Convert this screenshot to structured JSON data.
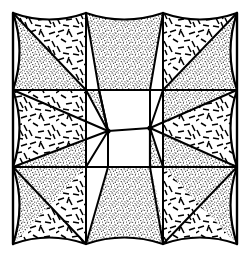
{
  "figure": {
    "kind": "geometric-line-drawing",
    "caption": "",
    "canvas": {
      "width": 248,
      "height": 259,
      "background": "#ffffff"
    },
    "ink_color": "#000000",
    "stipple_color": "#000000",
    "dash_color": "#000000"
  },
  "frame": {
    "name": "outer-border",
    "left": 13,
    "top": 13,
    "right": 237,
    "bottom": 244,
    "stroke_width": 2.2
  },
  "grid": {
    "columns": 3,
    "rows": 3,
    "vertical_lines_x": [
      86,
      163
    ],
    "horizontal_lines_y": [
      90,
      167
    ],
    "stroke_width": 2.0
  },
  "center": {
    "node_left": {
      "x": 108,
      "y": 131
    },
    "node_right": {
      "x": 150,
      "y": 128
    },
    "shape": "white-zigzag-parallelogram",
    "spokes_per_node": 6
  },
  "textures": {
    "stipple": {
      "name": "fine-dot-stipple",
      "density": "high",
      "dot_radius": 0.55
    },
    "dash": {
      "name": "scattered-dash-hatch",
      "density": "low",
      "dash_length": 7
    }
  },
  "cells": [
    {
      "index": 0,
      "name": "cell-top-left",
      "row": 0,
      "col": 0,
      "upper_fill": "dash",
      "lower_fill": "stipple",
      "concave_edges": [
        "top",
        "left"
      ]
    },
    {
      "index": 1,
      "name": "cell-top-center",
      "row": 0,
      "col": 1,
      "upper_fill": "stipple",
      "lower_fill": "blank",
      "concave_edges": [
        "top"
      ]
    },
    {
      "index": 2,
      "name": "cell-top-right",
      "row": 0,
      "col": 2,
      "upper_fill": "dash",
      "lower_fill": "stipple",
      "concave_edges": [
        "top",
        "right"
      ]
    },
    {
      "index": 3,
      "name": "cell-middle-left",
      "row": 1,
      "col": 0,
      "upper_fill": "dash",
      "lower_fill": "stipple",
      "concave_edges": [
        "left"
      ]
    },
    {
      "index": 4,
      "name": "cell-middle-center",
      "row": 1,
      "col": 1,
      "upper_fill": "stipple",
      "lower_fill": "blank",
      "concave_edges": []
    },
    {
      "index": 5,
      "name": "cell-middle-right",
      "row": 1,
      "col": 2,
      "upper_fill": "dash",
      "lower_fill": "stipple",
      "concave_edges": [
        "right"
      ]
    },
    {
      "index": 6,
      "name": "cell-bottom-left",
      "row": 2,
      "col": 0,
      "upper_fill": "stipple",
      "lower_fill": "dash",
      "concave_edges": [
        "bottom",
        "left"
      ]
    },
    {
      "index": 7,
      "name": "cell-bottom-center",
      "row": 2,
      "col": 1,
      "upper_fill": "stipple",
      "lower_fill": "blank",
      "concave_edges": [
        "bottom"
      ]
    },
    {
      "index": 8,
      "name": "cell-bottom-right",
      "row": 2,
      "col": 2,
      "upper_fill": "stipple",
      "lower_fill": "dash",
      "concave_edges": [
        "bottom",
        "right"
      ]
    }
  ],
  "corners": {
    "outer": [
      {
        "name": "corner-top-left",
        "x": 13,
        "y": 13
      },
      {
        "name": "corner-top-right",
        "x": 237,
        "y": 13
      },
      {
        "name": "corner-bottom-right",
        "x": 237,
        "y": 244
      },
      {
        "name": "corner-bottom-left",
        "x": 13,
        "y": 244
      }
    ],
    "edge_nodes": [
      {
        "name": "node-top-a",
        "x": 86,
        "y": 13
      },
      {
        "name": "node-top-b",
        "x": 163,
        "y": 13
      },
      {
        "name": "node-right-a",
        "x": 237,
        "y": 90
      },
      {
        "name": "node-right-b",
        "x": 237,
        "y": 167
      },
      {
        "name": "node-bottom-a",
        "x": 163,
        "y": 244
      },
      {
        "name": "node-bottom-b",
        "x": 86,
        "y": 244
      },
      {
        "name": "node-left-a",
        "x": 13,
        "y": 167
      },
      {
        "name": "node-left-b",
        "x": 13,
        "y": 90
      }
    ]
  }
}
